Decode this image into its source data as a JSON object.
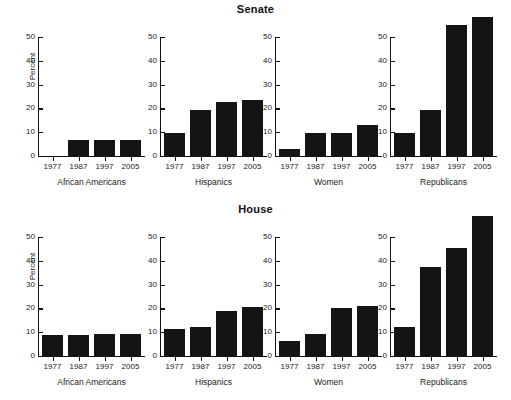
{
  "figure": {
    "width": 511,
    "height": 400,
    "background": "#ffffff",
    "bar_color": "#141414",
    "axis_color": "#111111"
  },
  "rows": [
    {
      "title": "Senate"
    },
    {
      "title": "House"
    }
  ],
  "axis": {
    "ylabel": "Percent",
    "yticks": [
      "0",
      "10",
      "20",
      "30",
      "40",
      "50"
    ],
    "ymin": 0,
    "ymax": 50,
    "xticks": [
      "1977",
      "1987",
      "1997",
      "2005"
    ]
  },
  "panels": [
    "African Americans",
    "Hispanics",
    "Women",
    "Republicans"
  ],
  "chart_data": {
    "type": "bar",
    "xlabel": "",
    "ylabel": "Percent",
    "ylim": [
      0,
      50
    ],
    "grid": false,
    "legend": "none",
    "categories": [
      "1977",
      "1987",
      "1997",
      "2005"
    ],
    "panel_titles": [
      "African Americans",
      "Hispanics",
      "Women",
      "Republicans"
    ],
    "row_titles": [
      "Senate",
      "House"
    ],
    "note": "Bars exceeding 50 are drawn above the axis top (Senate Republicans 1997 and 2005; House Republicans 2005).",
    "panels": [
      {
        "row": "Senate",
        "group": "African Americans",
        "categories": [
          "1977",
          "1987",
          "1997",
          "2005"
        ],
        "values": [
          0,
          6.7,
          6.7,
          6.7
        ]
      },
      {
        "row": "Senate",
        "group": "Hispanics",
        "categories": [
          "1977",
          "1987",
          "1997",
          "2005"
        ],
        "values": [
          9.5,
          19.5,
          22.5,
          23.5
        ]
      },
      {
        "row": "Senate",
        "group": "Women",
        "categories": [
          "1977",
          "1987",
          "1997",
          "2005"
        ],
        "values": [
          3.0,
          9.7,
          9.7,
          13.0
        ]
      },
      {
        "row": "Senate",
        "group": "Republicans",
        "categories": [
          "1977",
          "1987",
          "1997",
          "2005"
        ],
        "values": [
          9.7,
          19.5,
          55.0,
          58.5
        ]
      },
      {
        "row": "House",
        "group": "African Americans",
        "categories": [
          "1977",
          "1987",
          "1997",
          "2005"
        ],
        "values": [
          8.8,
          8.8,
          9.4,
          9.4
        ]
      },
      {
        "row": "House",
        "group": "Hispanics",
        "categories": [
          "1977",
          "1987",
          "1997",
          "2005"
        ],
        "values": [
          11.2,
          12.0,
          18.8,
          20.4
        ]
      },
      {
        "row": "House",
        "group": "Women",
        "categories": [
          "1977",
          "1987",
          "1997",
          "2005"
        ],
        "values": [
          6.5,
          9.3,
          20.0,
          21.0
        ]
      },
      {
        "row": "House",
        "group": "Republicans",
        "categories": [
          "1977",
          "1987",
          "1997",
          "2005"
        ],
        "values": [
          12.0,
          37.4,
          45.3,
          58.8
        ]
      }
    ]
  }
}
